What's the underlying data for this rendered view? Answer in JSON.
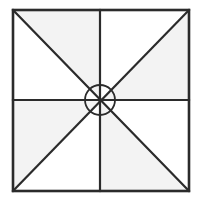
{
  "diagram": {
    "title": "",
    "colors": {
      "background": "#ffffff",
      "stroke": "#2b2b2b",
      "shade": "#f3f3f3",
      "unshaded": "#ffffff"
    },
    "square": {
      "x1": 13,
      "y1": 10,
      "x2": 189,
      "y2": 191
    },
    "center": {
      "x": 100,
      "y": 100
    },
    "center_circle": {
      "cx": 100,
      "cy": 100,
      "r": 15
    },
    "shaded_triangles": [
      {
        "name": "top-left-quadrant-upper",
        "points": "13,10 100,10 100,100"
      },
      {
        "name": "top-right-quadrant-right",
        "points": "189,10 189,100 100,100"
      },
      {
        "name": "bottom-right-quadrant-lower",
        "points": "189,191 100,191 100,100"
      },
      {
        "name": "bottom-left-quadrant-left",
        "points": "13,191 13,100 100,100"
      }
    ],
    "lines": [
      {
        "name": "diagonal-tl-br",
        "x1": 13,
        "y1": 10,
        "x2": 189,
        "y2": 191
      },
      {
        "name": "diagonal-tr-bl",
        "x1": 189,
        "y1": 10,
        "x2": 13,
        "y2": 191
      },
      {
        "name": "vertical-midline",
        "x1": 100,
        "y1": 10,
        "x2": 100,
        "y2": 191
      },
      {
        "name": "horizontal-midline",
        "x1": 13,
        "y1": 100,
        "x2": 189,
        "y2": 100
      }
    ],
    "stroke_width": 2.2
  }
}
